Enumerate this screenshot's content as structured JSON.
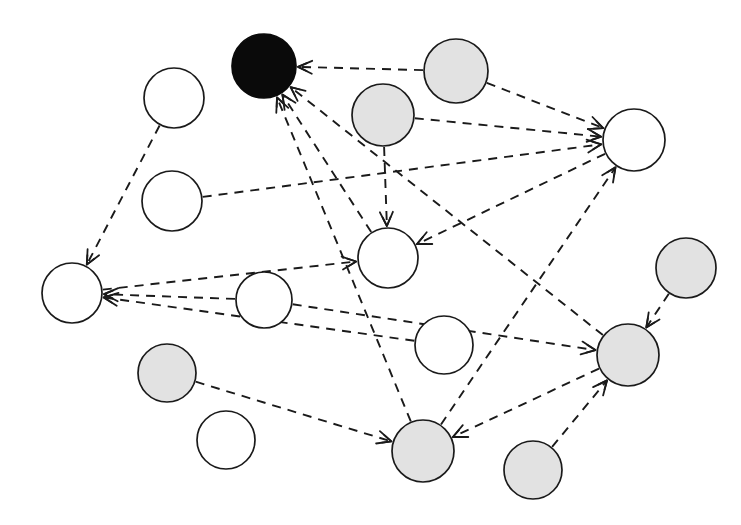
{
  "figure": {
    "kind": "directed-graph-diagram",
    "width": 741,
    "height": 525,
    "background": "#ffffff",
    "style": {
      "edge_style": "dashed",
      "edge_color": "#1a1a1a",
      "edge_width": 1.9,
      "node_stroke": "#1a1a1a",
      "arrowheads": "open-v"
    },
    "legend_colors": {
      "white_node_fill": "#ffffff",
      "gray_node_fill": "#e2e2e2",
      "black_node_fill": "#0a0a0a"
    }
  },
  "graph_data": {
    "type": "node-link-diagram",
    "directed": true,
    "node_count": 16,
    "edge_count": 19,
    "node_classes": [
      "white",
      "gray",
      "black"
    ],
    "nodes": [
      {
        "id": "n1",
        "label": "",
        "class": "black",
        "cx": 264,
        "cy": 66,
        "r": 32
      },
      {
        "id": "n2",
        "label": "",
        "class": "white",
        "cx": 174,
        "cy": 98,
        "r": 30
      },
      {
        "id": "n3",
        "label": "",
        "class": "white",
        "cx": 172,
        "cy": 201,
        "r": 30
      },
      {
        "id": "n4",
        "label": "",
        "class": "gray",
        "cx": 383,
        "cy": 115,
        "r": 31
      },
      {
        "id": "n5",
        "label": "",
        "class": "gray",
        "cx": 456,
        "cy": 71,
        "r": 32
      },
      {
        "id": "n6",
        "label": "",
        "class": "white",
        "cx": 634,
        "cy": 140,
        "r": 31
      },
      {
        "id": "n7",
        "label": "",
        "class": "white",
        "cx": 388,
        "cy": 258,
        "r": 30
      },
      {
        "id": "n8",
        "label": "",
        "class": "white",
        "cx": 72,
        "cy": 293,
        "r": 30
      },
      {
        "id": "n9",
        "label": "",
        "class": "white",
        "cx": 264,
        "cy": 300,
        "r": 28
      },
      {
        "id": "n10",
        "label": "",
        "class": "gray",
        "cx": 686,
        "cy": 268,
        "r": 30
      },
      {
        "id": "n11",
        "label": "",
        "class": "white",
        "cx": 444,
        "cy": 345,
        "r": 29
      },
      {
        "id": "n12",
        "label": "",
        "class": "gray",
        "cx": 628,
        "cy": 355,
        "r": 31
      },
      {
        "id": "n13",
        "label": "",
        "class": "gray",
        "cx": 167,
        "cy": 373,
        "r": 29
      },
      {
        "id": "n14",
        "label": "",
        "class": "white",
        "cx": 226,
        "cy": 440,
        "r": 29
      },
      {
        "id": "n15",
        "label": "",
        "class": "gray",
        "cx": 423,
        "cy": 451,
        "r": 31
      },
      {
        "id": "n16",
        "label": "",
        "class": "gray",
        "cx": 533,
        "cy": 470,
        "r": 29
      }
    ],
    "edges": [
      {
        "source": "n5",
        "target": "n1",
        "arrow": true
      },
      {
        "source": "n7",
        "target": "n1",
        "arrow": true
      },
      {
        "source": "n15",
        "target": "n1",
        "arrow": true
      },
      {
        "source": "n12",
        "target": "n1",
        "arrow": true
      },
      {
        "source": "n2",
        "target": "n8",
        "arrow": true
      },
      {
        "source": "n9",
        "target": "n8",
        "arrow": true
      },
      {
        "source": "n11",
        "target": "n8",
        "arrow": true
      },
      {
        "source": "n3",
        "target": "n6",
        "arrow": true
      },
      {
        "source": "n5",
        "target": "n6",
        "arrow": true
      },
      {
        "source": "n4",
        "target": "n6",
        "arrow": true
      },
      {
        "source": "n15",
        "target": "n6",
        "arrow": true
      },
      {
        "source": "n4",
        "target": "n7",
        "arrow": true
      },
      {
        "source": "n6",
        "target": "n7",
        "arrow": true
      },
      {
        "source": "n8",
        "target": "n7",
        "arrow": true
      },
      {
        "source": "n10",
        "target": "n12",
        "arrow": true
      },
      {
        "source": "n9",
        "target": "n12",
        "arrow": true
      },
      {
        "source": "n16",
        "target": "n12",
        "arrow": true
      },
      {
        "source": "n13",
        "target": "n15",
        "arrow": true
      },
      {
        "source": "n12",
        "target": "n15",
        "arrow": true
      }
    ]
  }
}
